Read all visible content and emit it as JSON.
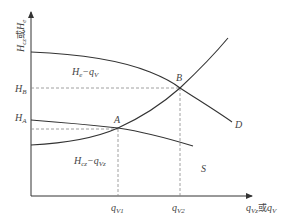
{
  "figure": {
    "colors": {
      "axis": "#333333",
      "curve": "#333333",
      "dash": "#888888",
      "text": "#444444",
      "background": "#ffffff"
    },
    "y_axis": {
      "label_main": "H",
      "label_sub1": "cz",
      "label_mid": "或",
      "label_main2": "H",
      "label_sub2": "e"
    },
    "x_axis": {
      "label_main": "q",
      "label_sub1": "Vz",
      "label_mid": "或",
      "label_main2": "q",
      "label_sub2": "V"
    },
    "y_ticks": {
      "HB": {
        "main": "H",
        "sub": "B"
      },
      "HA": {
        "main": "H",
        "sub": "A"
      }
    },
    "x_ticks": {
      "qV1": {
        "main": "q",
        "sub": "V1"
      },
      "qV2": {
        "main": "q",
        "sub": "V2"
      }
    },
    "points": {
      "A": "A",
      "B": "B",
      "D": "D",
      "S": "S"
    },
    "curve_labels": {
      "pump": {
        "main": "H",
        "sub": "e",
        "dash": "−",
        "q": "q",
        "qsub": "V"
      },
      "system": {
        "main": "H",
        "sub": "cz",
        "dash": "−",
        "q": "q",
        "qsub": "Vz"
      }
    }
  }
}
